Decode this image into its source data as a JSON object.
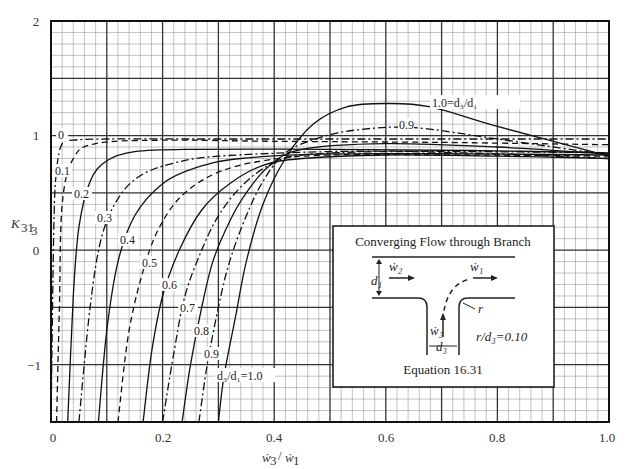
{
  "chart_data": {
    "type": "line",
    "title": "",
    "xlabel": "ẇ3 / ẇ1",
    "ylabel": "K31₃",
    "xlim": [
      0,
      1.0
    ],
    "ylim": [
      -1.5,
      2
    ],
    "grid": true,
    "x_ticks": [
      "0",
      "0.2",
      "0.4",
      "0.6",
      "0.8",
      "1.0"
    ],
    "y_ticks": [
      "2",
      "1",
      "0",
      "−1"
    ],
    "legend": "inline curve labels (d3/d1)",
    "series": [
      {
        "name": "0",
        "style": "dash-dot",
        "x": [
          0.0,
          0.005,
          0.01,
          0.02,
          0.04,
          0.1,
          0.3,
          0.6,
          1.0
        ],
        "y": [
          -1.5,
          0.2,
          0.7,
          0.93,
          0.96,
          0.97,
          0.97,
          0.97,
          0.97
        ]
      },
      {
        "name": "0.1",
        "style": "dashed",
        "x": [
          0.01,
          0.015,
          0.02,
          0.04,
          0.08,
          0.2,
          0.4,
          0.7,
          1.0
        ],
        "y": [
          -1.5,
          -0.5,
          0.4,
          0.8,
          0.93,
          0.96,
          0.95,
          0.94,
          0.92
        ]
      },
      {
        "name": "0.2",
        "style": "solid",
        "x": [
          0.03,
          0.04,
          0.05,
          0.07,
          0.1,
          0.15,
          0.25,
          0.5,
          0.75,
          1.0
        ],
        "y": [
          -1.5,
          -0.4,
          0.2,
          0.6,
          0.78,
          0.86,
          0.88,
          0.88,
          0.87,
          0.85
        ]
      },
      {
        "name": "0.3",
        "style": "dash-dot",
        "x": [
          0.05,
          0.07,
          0.09,
          0.12,
          0.16,
          0.22,
          0.3,
          0.5,
          0.75,
          1.0
        ],
        "y": [
          -1.5,
          -0.5,
          0.1,
          0.45,
          0.65,
          0.76,
          0.82,
          0.86,
          0.86,
          0.85
        ]
      },
      {
        "name": "0.4",
        "style": "solid",
        "x": [
          0.085,
          0.1,
          0.12,
          0.15,
          0.2,
          0.26,
          0.34,
          0.5,
          0.75,
          1.0
        ],
        "y": [
          -1.5,
          -0.7,
          -0.1,
          0.3,
          0.58,
          0.72,
          0.8,
          0.84,
          0.84,
          0.83
        ]
      },
      {
        "name": "0.5",
        "style": "dashed",
        "x": [
          0.12,
          0.14,
          0.17,
          0.2,
          0.24,
          0.3,
          0.38,
          0.5,
          0.75,
          1.0
        ],
        "y": [
          -1.5,
          -0.7,
          -0.1,
          0.25,
          0.5,
          0.68,
          0.78,
          0.83,
          0.83,
          0.82
        ]
      },
      {
        "name": "0.6",
        "style": "solid",
        "x": [
          0.165,
          0.18,
          0.2,
          0.23,
          0.27,
          0.32,
          0.38,
          0.45,
          0.6,
          0.8,
          1.0
        ],
        "y": [
          -1.5,
          -0.9,
          -0.4,
          0.0,
          0.35,
          0.58,
          0.74,
          0.8,
          0.83,
          0.82,
          0.8
        ]
      },
      {
        "name": "0.7",
        "style": "dash-dot",
        "x": [
          0.2,
          0.22,
          0.24,
          0.27,
          0.3,
          0.34,
          0.39,
          0.45,
          0.6,
          0.8,
          1.0
        ],
        "y": [
          -1.5,
          -0.9,
          -0.4,
          0.0,
          0.3,
          0.55,
          0.74,
          0.83,
          0.86,
          0.84,
          0.8
        ]
      },
      {
        "name": "0.8",
        "style": "solid",
        "x": [
          0.235,
          0.25,
          0.27,
          0.29,
          0.32,
          0.35,
          0.39,
          0.45,
          0.6,
          0.8,
          1.0
        ],
        "y": [
          -1.5,
          -1.0,
          -0.5,
          -0.1,
          0.25,
          0.5,
          0.73,
          0.88,
          0.93,
          0.9,
          0.84
        ]
      },
      {
        "name": "0.9",
        "style": "dash-dot",
        "x": [
          0.265,
          0.28,
          0.3,
          0.32,
          0.35,
          0.38,
          0.42,
          0.48,
          0.55,
          0.65,
          0.8,
          1.0
        ],
        "y": [
          -1.5,
          -1.0,
          -0.5,
          -0.1,
          0.3,
          0.6,
          0.85,
          0.98,
          1.05,
          1.07,
          0.97,
          0.83
        ]
      },
      {
        "name": "1.0 = d3/d1",
        "style": "solid",
        "x": [
          0.3,
          0.31,
          0.33,
          0.35,
          0.38,
          0.42,
          0.47,
          0.53,
          0.6,
          0.68,
          0.8,
          1.0
        ],
        "y": [
          -1.5,
          -1.1,
          -0.6,
          -0.1,
          0.4,
          0.8,
          1.1,
          1.25,
          1.28,
          1.25,
          1.08,
          0.82
        ]
      }
    ],
    "annotations": [
      "1.0=d3/d1",
      "0.9",
      "0",
      "0.1",
      "0.2",
      "0.3",
      "0.4",
      "0.5",
      "0.6",
      "0.7",
      "0.8",
      "0.9",
      "d3/d1=1.0"
    ]
  },
  "axes": {
    "x_ticks": [
      "0",
      "0.2",
      "0.4",
      "0.6",
      "0.8",
      "1.0"
    ],
    "y_ticks": [
      "2",
      "1",
      "0",
      "−1"
    ],
    "xlabel_main": "ẇ",
    "xlabel_sub_num": "3",
    "xlabel_slash": "/",
    "xlabel_sub_den": "1",
    "ylabel_main": "K",
    "ylabel_sub": "31",
    "ylabel_subsub": "3"
  },
  "curve_labels": {
    "top_curve": "1.0=d₃/d₁",
    "second_curve": "0.9",
    "left_labels": [
      "0",
      "0.1",
      "0.2",
      "0.3",
      "0.4",
      "0.5",
      "0.6",
      "0.7",
      "0.8",
      "0.9"
    ],
    "bottom_label": "d₃/d₁=1.0"
  },
  "inset": {
    "title": "Converging Flow through Branch",
    "w2": "ẇ₂",
    "w1": "ẇ₁",
    "w3": "ẇ₃",
    "d1": "d₁",
    "d3": "d₃",
    "r": "r",
    "ratio": "r/d₃=0.10",
    "equation": "Equation 16.31"
  }
}
